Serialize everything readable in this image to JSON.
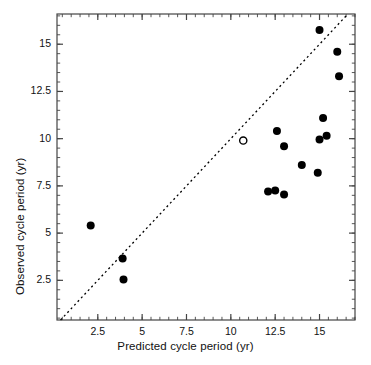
{
  "figure": {
    "kind": "scatter-plot",
    "background": "#ffffff",
    "frame_color": "#444444",
    "point_color": "#000000",
    "open_point_color": "#000000",
    "reference_line_style": "dashed",
    "reference_line_label": "one-to-one line"
  },
  "chart_data": {
    "type": "scatter",
    "title": "",
    "xlabel": "Predicted cycle period (yr)",
    "ylabel": "Observed cycle period (yr)",
    "xlim": [
      0.2,
      17.0
    ],
    "ylim": [
      0.4,
      16.6
    ],
    "xticks": [
      2.5,
      5,
      7.5,
      10,
      12.5,
      15
    ],
    "xticklabels": [
      "2.5",
      "5",
      "7.5",
      "10",
      "12.5",
      "15"
    ],
    "yticks": [
      2.5,
      5,
      7.5,
      10,
      12.5,
      15
    ],
    "yticklabels": [
      "2.5",
      "5",
      "7.5",
      "10",
      "12.5",
      "15"
    ],
    "minor_ticks": true,
    "grid": false,
    "legend": null,
    "reference_line": {
      "type": "identity",
      "from": [
        0.4,
        0.4
      ],
      "to": [
        16.6,
        16.6
      ],
      "dash": "2 3"
    },
    "series": [
      {
        "name": "filled",
        "marker": "filled-circle",
        "values": [
          [
            2.1,
            5.4
          ],
          [
            3.9,
            3.65
          ],
          [
            3.95,
            2.55
          ],
          [
            12.1,
            7.2
          ],
          [
            12.5,
            7.25
          ],
          [
            12.6,
            10.4
          ],
          [
            13.0,
            7.05
          ],
          [
            13.0,
            9.6
          ],
          [
            14.0,
            8.6
          ],
          [
            14.9,
            8.2
          ],
          [
            15.0,
            15.75
          ],
          [
            15.0,
            9.95
          ],
          [
            15.2,
            11.1
          ],
          [
            15.4,
            10.15
          ],
          [
            16.0,
            14.6
          ],
          [
            16.1,
            13.3
          ]
        ]
      },
      {
        "name": "open",
        "marker": "open-circle",
        "values": [
          [
            10.7,
            9.9
          ]
        ]
      }
    ]
  }
}
